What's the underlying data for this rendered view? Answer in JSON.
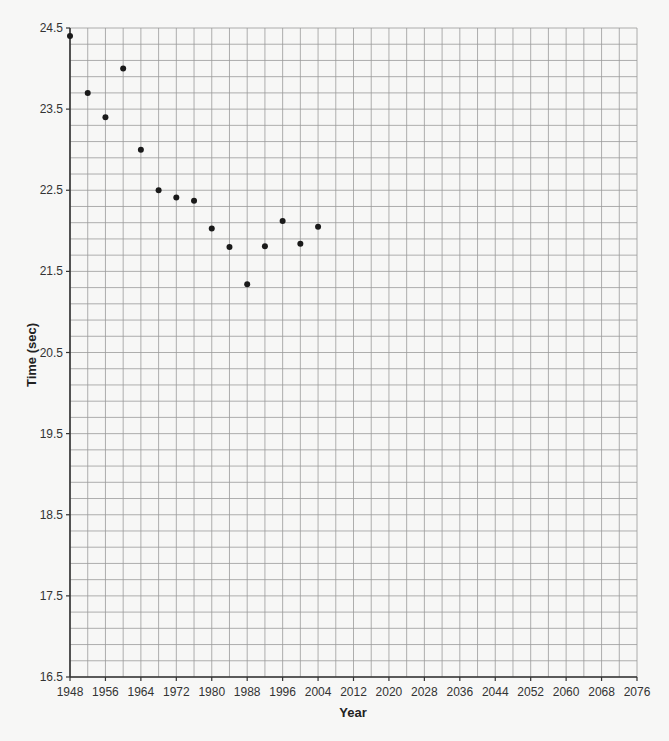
{
  "chart_data": {
    "type": "scatter",
    "title": "",
    "xlabel": "Year",
    "ylabel": "Time (sec)",
    "xlim": [
      1948,
      2076
    ],
    "ylim": [
      16.5,
      24.5
    ],
    "x_ticks": [
      "1948",
      "1956",
      "1964",
      "1972",
      "1980",
      "1988",
      "1996",
      "2004",
      "2012",
      "2020",
      "2028",
      "2036",
      "2044",
      "2052",
      "2060",
      "2068",
      "2076"
    ],
    "y_ticks": [
      "16.5",
      "17.5",
      "18.5",
      "19.5",
      "20.5",
      "21.5",
      "22.5",
      "23.5",
      "24.5"
    ],
    "grid": true,
    "x_grid_step": 4,
    "y_grid_step": 0.2,
    "legend": null,
    "series": [
      {
        "name": "Time",
        "x": [
          1948,
          1952,
          1956,
          1960,
          1964,
          1968,
          1972,
          1976,
          1980,
          1984,
          1988,
          1992,
          1996,
          2000,
          2004
        ],
        "values": [
          24.4,
          23.7,
          23.4,
          24.0,
          23.0,
          22.5,
          22.41,
          22.37,
          22.03,
          21.8,
          21.34,
          21.81,
          22.12,
          21.84,
          22.05
        ]
      }
    ]
  },
  "colors": {
    "background": "#f7f7f6",
    "grid": "#9a9a9a",
    "axis": "#333333",
    "point": "#1a1a1a"
  }
}
